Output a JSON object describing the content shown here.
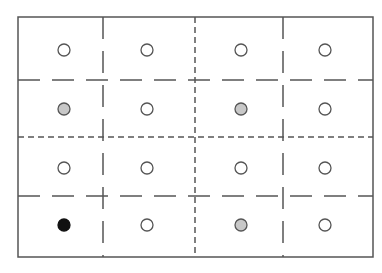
{
  "diagram": {
    "grid": {
      "rows": 4,
      "cols": 4,
      "outer_box": {
        "x": 18,
        "y": 17,
        "width": 355,
        "height": 240
      },
      "row_boundaries_y": [
        17,
        80,
        137,
        196,
        257
      ],
      "col_boundaries_x": [
        18,
        103,
        195,
        283,
        373
      ],
      "major_dashed_lines": {
        "vertical_x": 195,
        "horizontal_y": 137,
        "style": "short-dash"
      },
      "minor_dashed_lines": {
        "vertical_x": [
          103,
          283
        ],
        "horizontal_y": [
          80,
          196
        ],
        "style": "long-dash"
      }
    },
    "colors": {
      "line": "#555555",
      "empty_fill": "#ffffff",
      "gray_fill": "#c8c8c8",
      "black_fill": "#111111"
    },
    "row_centers_y": [
      50,
      109,
      168,
      225
    ],
    "col_centers_x": [
      64,
      147,
      241,
      325
    ],
    "cells": [
      [
        "empty",
        "empty",
        "empty",
        "empty"
      ],
      [
        "gray",
        "empty",
        "gray",
        "empty"
      ],
      [
        "empty",
        "empty",
        "empty",
        "empty"
      ],
      [
        "black",
        "empty",
        "gray",
        "empty"
      ]
    ]
  }
}
